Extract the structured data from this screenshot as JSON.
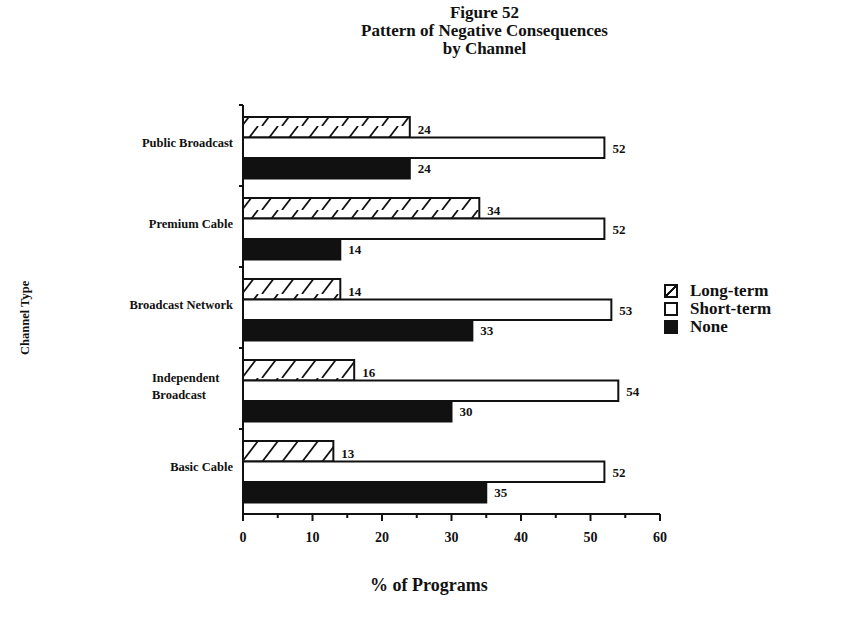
{
  "chart_data": {
    "type": "bar",
    "orientation": "horizontal",
    "title": "Figure 52",
    "subtitle": "Pattern of Negative Consequences by Channel",
    "title_lines": [
      "Figure 52",
      "Pattern of Negative Consequences",
      "by Channel"
    ],
    "xlabel": "% of Programs",
    "ylabel": "Channel Type",
    "xlim": [
      0,
      60
    ],
    "xticks": [
      0,
      10,
      20,
      30,
      40,
      50,
      60
    ],
    "grid": false,
    "legend_position": "right",
    "categories": [
      "Public Broadcast",
      "Premium Cable",
      "Broadcast Network",
      "Independent Broadcast",
      "Basic Cable"
    ],
    "series": [
      {
        "name": "Long-term",
        "pattern": "diagonal-hatch",
        "color": "#ffffff",
        "values": [
          24,
          34,
          14,
          16,
          13
        ]
      },
      {
        "name": "Short-term",
        "pattern": "none",
        "color": "#ffffff",
        "values": [
          52,
          52,
          53,
          54,
          52
        ]
      },
      {
        "name": "None",
        "pattern": "solid",
        "color": "#111111",
        "values": [
          24,
          14,
          33,
          30,
          35
        ]
      }
    ]
  },
  "labels": {
    "category_lines": [
      [
        "Public Broadcast"
      ],
      [
        "Premium Cable"
      ],
      [
        "Broadcast Network"
      ],
      [
        "Independent",
        "Broadcast"
      ],
      [
        "Basic Cable"
      ]
    ]
  }
}
